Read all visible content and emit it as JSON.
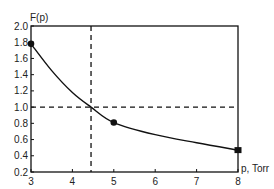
{
  "chart_data": {
    "type": "line",
    "title": "",
    "xlabel": "p, Torr",
    "ylabel": "F(p)",
    "xlim": [
      3,
      8
    ],
    "ylim": [
      0.2,
      2.0
    ],
    "x_ticks": [
      3,
      4,
      5,
      6,
      7,
      8
    ],
    "y_ticks": [
      0.2,
      0.4,
      0.6,
      0.8,
      1.0,
      1.2,
      1.4,
      1.6,
      1.8,
      2.0
    ],
    "x_tick_labels": [
      "3",
      "4",
      "5",
      "6",
      "7",
      "8"
    ],
    "y_tick_labels": [
      "0.2",
      "0.4",
      "0.6",
      "0.8",
      "1.0",
      "1.2",
      "1.4",
      "1.6",
      "1.8",
      "2.0"
    ],
    "grid": false,
    "legend": null,
    "series": [
      {
        "name": "F(p)",
        "markers": [
          {
            "x": 3,
            "y": 1.78,
            "shape": "circle"
          },
          {
            "x": 5,
            "y": 0.81,
            "shape": "circle"
          },
          {
            "x": 8,
            "y": 0.47,
            "shape": "square"
          }
        ],
        "curve": [
          {
            "x": 3.0,
            "y": 1.78
          },
          {
            "x": 3.5,
            "y": 1.45
          },
          {
            "x": 4.0,
            "y": 1.18
          },
          {
            "x": 4.45,
            "y": 1.0
          },
          {
            "x": 5.0,
            "y": 0.81
          },
          {
            "x": 6.0,
            "y": 0.66
          },
          {
            "x": 7.0,
            "y": 0.56
          },
          {
            "x": 8.0,
            "y": 0.47
          }
        ]
      }
    ],
    "reference_lines": [
      {
        "orientation": "vertical",
        "x": 4.45,
        "style": "dashed"
      },
      {
        "orientation": "horizontal",
        "y": 1.0,
        "style": "dashed"
      }
    ]
  },
  "colors": {
    "line": "#111111",
    "axis": "#111111",
    "text": "#222222",
    "background": "#ffffff"
  }
}
